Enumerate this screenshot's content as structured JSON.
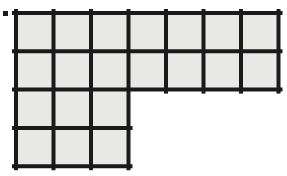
{
  "figure": {
    "name": "l-shaped-grid-of-squares",
    "total_squares": 20,
    "background_color": "#ffffff",
    "cell_fill_color": "#e8e8e6",
    "line_color": "#1a1a1a",
    "line_width_px": 4,
    "origin": {
      "x": 16,
      "y": 13
    },
    "cell_width_px": 37.5,
    "cell_height_px": 38.3,
    "rows": [
      {
        "index": 0,
        "columns": 7
      },
      {
        "index": 1,
        "columns": 7
      },
      {
        "index": 2,
        "columns": 3
      },
      {
        "index": 3,
        "columns": 3
      }
    ],
    "column_gridlines_x": [
      16,
      53.5,
      91,
      128.5,
      166,
      203.5,
      241,
      278.5
    ],
    "row_gridlines_y": [
      13,
      51.3,
      89.6,
      127.9,
      166.2
    ],
    "outline_path": "M16,13 H278.5 V89.6 H128.5 V166.2 H16 Z"
  },
  "artifact": {
    "name": "corner-speck",
    "x": 3,
    "y": 11,
    "width": 5,
    "height": 5,
    "color": "#1a1a1a"
  }
}
